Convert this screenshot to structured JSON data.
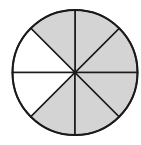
{
  "diagram": {
    "type": "fraction-circle",
    "total_parts": 8,
    "shaded_parts": 6,
    "unshaded_parts": 2,
    "colors": {
      "shaded": "#d4d4d4",
      "unshaded": "#ffffff",
      "stroke": "#1a1a1a",
      "background": "#ffffff"
    },
    "sectors": [
      {
        "index": 0,
        "position": "right-upper",
        "shaded": true
      },
      {
        "index": 1,
        "position": "top-right",
        "shaded": true
      },
      {
        "index": 2,
        "position": "top-left",
        "shaded": true
      },
      {
        "index": 3,
        "position": "left-upper",
        "shaded": false
      },
      {
        "index": 4,
        "position": "left-lower",
        "shaded": false
      },
      {
        "index": 5,
        "position": "bottom-left",
        "shaded": true
      },
      {
        "index": 6,
        "position": "bottom-right",
        "shaded": true
      },
      {
        "index": 7,
        "position": "right-lower",
        "shaded": true
      }
    ]
  }
}
